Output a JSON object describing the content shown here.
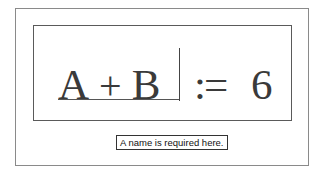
{
  "worksheet": {
    "expression": {
      "lhs_a": "A",
      "operator_plus": "+",
      "lhs_b": "B",
      "definition_operator": ":=",
      "rhs_value": "6"
    },
    "error_tooltip": "A name is required here."
  }
}
